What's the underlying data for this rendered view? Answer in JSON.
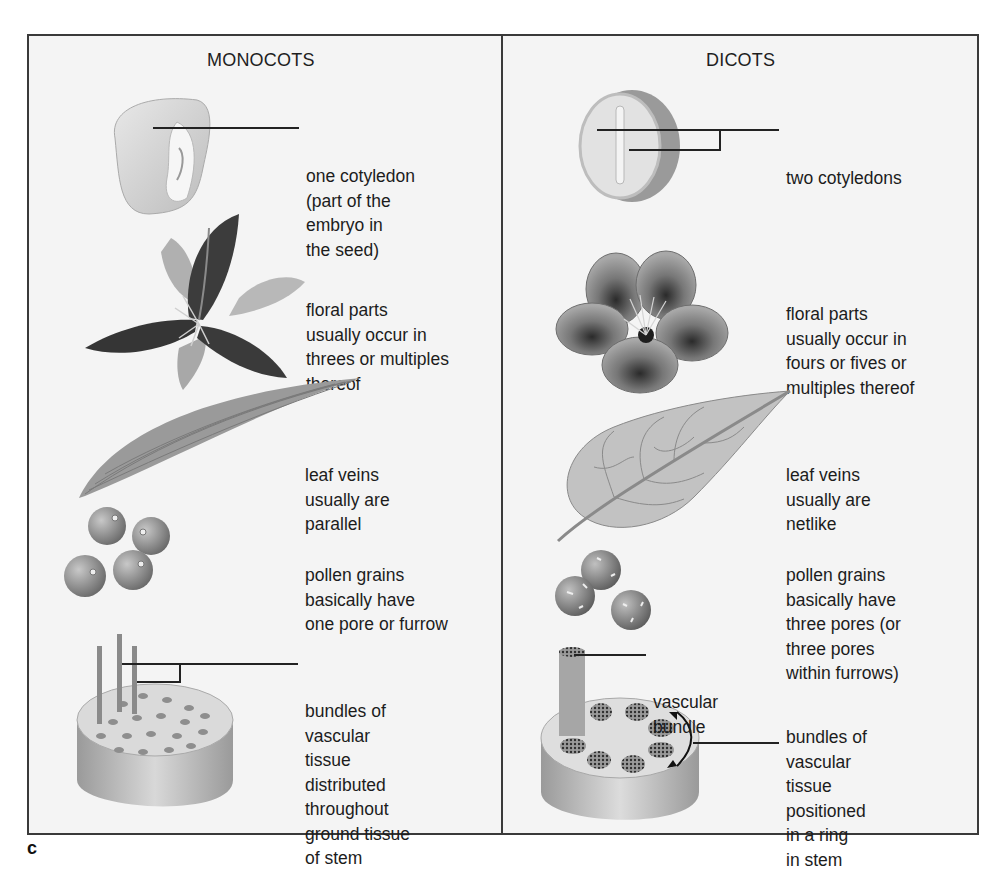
{
  "figure": {
    "panel_letter": "c",
    "colors": {
      "frame": "#3a3a3a",
      "background": "#f4f4f4",
      "text": "#1c1c1c"
    }
  },
  "monocots": {
    "title": "MONOCOTS",
    "rows": [
      {
        "feature": "seed",
        "icon": "corn-kernel-icon",
        "lines": [
          "one cotyledon",
          "(part of the",
          "embryo in",
          "the seed)"
        ]
      },
      {
        "feature": "flower",
        "icon": "lily-flower-icon",
        "lines": [
          "floral parts",
          "usually occur in",
          "threes or multiples",
          "thereof"
        ]
      },
      {
        "feature": "leaf",
        "icon": "parallel-vein-leaf-icon",
        "lines": [
          "leaf veins",
          "usually are",
          "parallel"
        ]
      },
      {
        "feature": "pollen",
        "icon": "pollen-grains-icon",
        "lines": [
          "pollen grains",
          "basically have",
          "one pore or furrow"
        ]
      },
      {
        "feature": "stem",
        "icon": "scattered-bundle-stem-icon",
        "lines": [
          "bundles of",
          "vascular",
          "tissue",
          "distributed",
          "throughout",
          "ground tissue",
          "of stem"
        ]
      }
    ]
  },
  "dicots": {
    "title": "DICOTS",
    "rows": [
      {
        "feature": "seed",
        "icon": "bean-seed-icon",
        "lines": [
          "two cotyledons"
        ]
      },
      {
        "feature": "flower",
        "icon": "five-petal-flower-icon",
        "lines": [
          "floral parts",
          "usually occur in",
          "fours or fives or",
          "multiples thereof"
        ]
      },
      {
        "feature": "leaf",
        "icon": "netted-vein-leaf-icon",
        "lines": [
          "leaf veins",
          "usually are",
          "netlike"
        ]
      },
      {
        "feature": "pollen",
        "icon": "pollen-grains-icon",
        "lines": [
          "pollen grains",
          "basically have",
          "three pores (or",
          "three pores",
          "within furrows)"
        ]
      },
      {
        "feature": "stem-callout",
        "icon": "vascular-bundle-icon",
        "lines": [
          "vascular",
          "bundle"
        ]
      },
      {
        "feature": "stem",
        "icon": "ring-bundle-stem-icon",
        "lines": [
          "bundles of",
          "vascular",
          "tissue",
          "positioned",
          "in a ring",
          "in stem"
        ]
      }
    ]
  }
}
